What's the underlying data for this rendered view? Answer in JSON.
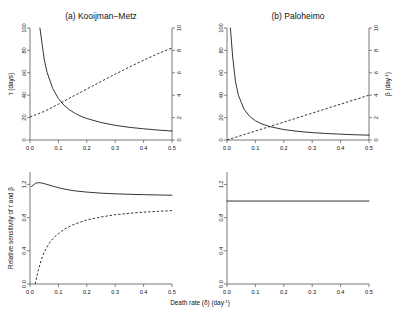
{
  "figure": {
    "xlabel_main": "Death rate (δ) (day",
    "xlabel_sup": "-1",
    "xlabel_tail": ")"
  },
  "panels": {
    "a": {
      "title": "(a)  Kooijman−Metz"
    },
    "b": {
      "title": "(b)  Paloheimo"
    }
  },
  "axes": {
    "x_ticks": [
      "0.0",
      "0.1",
      "0.2",
      "0.3",
      "0.4",
      "0.5"
    ],
    "tau_ticks": [
      "0",
      "20",
      "40",
      "60",
      "80",
      "100"
    ],
    "beta_ticks": [
      "0",
      "2",
      "4",
      "6",
      "8",
      "10"
    ],
    "sens_ticks": [
      "0.0",
      "0.4",
      "0.8",
      "1.2"
    ],
    "tau_label": "τ (days)",
    "beta_label_main": "β (day",
    "beta_label_sup": "-1",
    "beta_label_tail": ")",
    "sens_label": "Relative sensitivity of τ and β"
  },
  "chart_data": {
    "type": "line",
    "xlabel": "Death rate (δ) (day-1)",
    "xlim": [
      0.0,
      0.5
    ],
    "grid": false,
    "legend": "none",
    "panels": [
      {
        "id": "a",
        "position": "top-left",
        "title": "(a)  Kooijman−Metz",
        "ylabel_left": "τ (days)",
        "ylim_left": [
          0,
          100
        ],
        "ylabel_right": "β (day-1)",
        "ylim_right": [
          0,
          10
        ],
        "series": [
          {
            "name": "tau",
            "axis": "left",
            "style": "solid",
            "x": [
              0.035,
              0.05,
              0.06,
              0.08,
              0.1,
              0.12,
              0.14,
              0.16,
              0.18,
              0.2,
              0.25,
              0.3,
              0.35,
              0.4,
              0.45,
              0.5
            ],
            "values": [
              100.0,
              72.0,
              60.5,
              46.0,
              37.0,
              31.0,
              26.8,
              23.6,
              21.1,
              19.2,
              15.6,
              13.1,
              11.3,
              10.0,
              8.9,
              8.0
            ]
          },
          {
            "name": "beta",
            "axis": "right",
            "style": "dashed",
            "x": [
              0.0,
              0.05,
              0.1,
              0.15,
              0.2,
              0.25,
              0.3,
              0.35,
              0.4,
              0.45,
              0.5
            ],
            "values": [
              2.05,
              2.55,
              3.2,
              3.88,
              4.55,
              5.22,
              5.88,
              6.52,
              7.12,
              7.7,
              8.22
            ]
          }
        ]
      },
      {
        "id": "b",
        "position": "top-right",
        "title": "(b)  Paloheimo",
        "ylabel_left": "τ (days)",
        "ylim_left": [
          0,
          100
        ],
        "ylabel_right": "β (day-1)",
        "ylim_right": [
          0,
          10
        ],
        "series": [
          {
            "name": "tau",
            "axis": "left",
            "style": "solid",
            "x": [
              0.012,
              0.02,
              0.03,
              0.04,
              0.06,
              0.08,
              0.1,
              0.12,
              0.15,
              0.2,
              0.25,
              0.3,
              0.35,
              0.4,
              0.45,
              0.5
            ],
            "values": [
              100.0,
              74.0,
              52.0,
              40.0,
              27.5,
              21.0,
              17.2,
              14.6,
              12.0,
              9.3,
              7.7,
              6.6,
              5.8,
              5.2,
              4.7,
              4.3
            ]
          },
          {
            "name": "beta",
            "axis": "right",
            "style": "dashed",
            "x": [
              0.0,
              0.1,
              0.2,
              0.3,
              0.4,
              0.5
            ],
            "values": [
              0.0,
              0.8,
              1.6,
              2.4,
              3.2,
              4.0
            ]
          }
        ]
      },
      {
        "id": "c",
        "position": "bottom-left",
        "ylabel": "Relative sensitivity of τ and β",
        "ylim": [
          0.0,
          1.35
        ],
        "series": [
          {
            "name": "tau sensitivity",
            "style": "solid",
            "x": [
              0.005,
              0.02,
              0.03,
              0.04,
              0.05,
              0.07,
              0.1,
              0.13,
              0.16,
              0.2,
              0.25,
              0.3,
              0.35,
              0.4,
              0.45,
              0.5
            ],
            "values": [
              1.175,
              1.215,
              1.222,
              1.218,
              1.21,
              1.19,
              1.16,
              1.138,
              1.122,
              1.108,
              1.095,
              1.087,
              1.081,
              1.077,
              1.073,
              1.07
            ]
          },
          {
            "name": "beta sensitivity",
            "style": "dashed",
            "x": [
              0.018,
              0.03,
              0.04,
              0.05,
              0.07,
              0.09,
              0.12,
              0.15,
              0.2,
              0.25,
              0.3,
              0.35,
              0.4,
              0.45,
              0.5
            ],
            "values": [
              0.0,
              0.175,
              0.295,
              0.385,
              0.505,
              0.58,
              0.66,
              0.712,
              0.772,
              0.808,
              0.835,
              0.852,
              0.866,
              0.876,
              0.884
            ]
          }
        ]
      },
      {
        "id": "d",
        "position": "bottom-right",
        "ylim": [
          0.0,
          1.35
        ],
        "series": [
          {
            "name": "sensitivity",
            "style": "solid",
            "x": [
              0.0,
              0.5
            ],
            "values": [
              1.0,
              1.0
            ]
          }
        ]
      }
    ]
  }
}
